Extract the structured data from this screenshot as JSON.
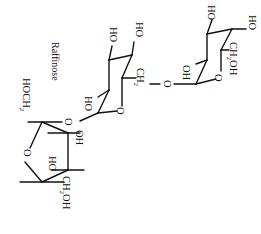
{
  "title": "Raffinose",
  "rings": [
    {
      "name": "galactose",
      "labels": {
        "ho_top_left": "HO",
        "ho_top_right": "HO",
        "ch2oh": "CH",
        "ch2oh_sub": "2",
        "ch2oh_tail": "OH",
        "ring_oxygen": "O",
        "oh_anomeric": "OH"
      }
    },
    {
      "name": "glucose",
      "labels": {
        "ho_top_left": "HO",
        "ho_top_right": "HO",
        "ch2": "CH",
        "ch2_sub": "2",
        "ring_oxygen": "O",
        "ho_bottom": "HO"
      }
    },
    {
      "name": "fructose",
      "labels": {
        "hoch2": "HOCH",
        "hoch2_sub": "2",
        "ring_oxygen": "O",
        "oh": "OH",
        "ho": "HO",
        "ch2oh": "CH",
        "ch2oh_sub": "2",
        "ch2oh_tail": "OH"
      }
    }
  ],
  "linkages": {
    "gal_glc_oxygen": "O",
    "glc_fru_oxygen": "O"
  }
}
